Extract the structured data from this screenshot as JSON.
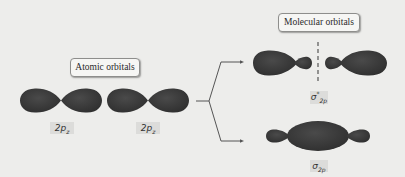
{
  "diagram": {
    "title_boxes": {
      "atomic": "Atomic orbitals",
      "molecular": "Molecular orbitals"
    },
    "atomic_orbitals": [
      {
        "symbol": "2p",
        "subscript": "z"
      },
      {
        "symbol": "2p",
        "subscript": "z"
      }
    ],
    "molecular_orbitals": {
      "antibonding": {
        "symbol": "σ",
        "superscript": "*",
        "subscript": "2p",
        "has_node": true
      },
      "bonding": {
        "symbol": "σ",
        "superscript": "",
        "subscript": "2p",
        "has_node": false
      }
    },
    "colors": {
      "background": "#ededeb",
      "lobe": "#3d3d3d",
      "line": "#555555",
      "label_bg": "#dcdcda",
      "box_border": "#8e8e8c"
    }
  }
}
